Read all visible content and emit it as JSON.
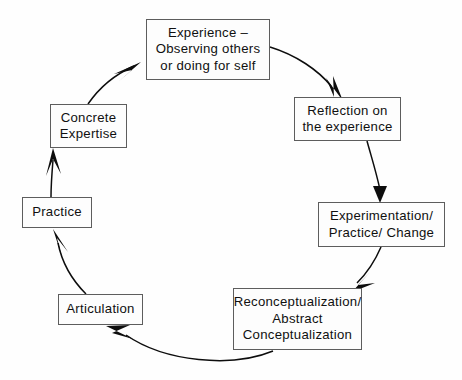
{
  "diagram": {
    "type": "cycle-diagram",
    "background_color": "#fefefe",
    "box_border_color": "#5d5d5d",
    "box_fill_color": "#fdfdfd",
    "arrow_color": "#0d0d0d",
    "text_color": "#101010",
    "nodes": [
      {
        "id": "experience",
        "label": "Experience –\nObserving others\nor doing for self",
        "order": 1
      },
      {
        "id": "reflection",
        "label": "Reflection on\nthe experience",
        "order": 2
      },
      {
        "id": "experimentation",
        "label": "Experimentation/\nPractice/ Change",
        "order": 4
      },
      {
        "id": "reconceptualization",
        "label": "Reconceptualization/\nAbstract\nConceptualization",
        "order": 3
      },
      {
        "id": "articulation",
        "label": "Articulation",
        "order": 5
      },
      {
        "id": "practice",
        "label": "Practice",
        "order": 6
      },
      {
        "id": "expertise",
        "label": "Concrete\nExpertise",
        "order": 7
      }
    ],
    "arrows": [
      {
        "id": "experience-to-reflection",
        "from": "experience",
        "to": "reflection"
      },
      {
        "id": "reflection-to-experimentation",
        "from": "reflection",
        "to": "experimentation"
      },
      {
        "id": "experimentation-to-reconceptual",
        "from": "experimentation",
        "to": "reconceptualization"
      },
      {
        "id": "reconceptual-to-articulation",
        "from": "reconceptualization",
        "to": "articulation"
      },
      {
        "id": "articulation-to-practice",
        "from": "articulation",
        "to": "practice"
      },
      {
        "id": "practice-to-expertise",
        "from": "practice",
        "to": "expertise"
      },
      {
        "id": "expertise-to-experience",
        "from": "expertise",
        "to": "experience"
      }
    ]
  }
}
